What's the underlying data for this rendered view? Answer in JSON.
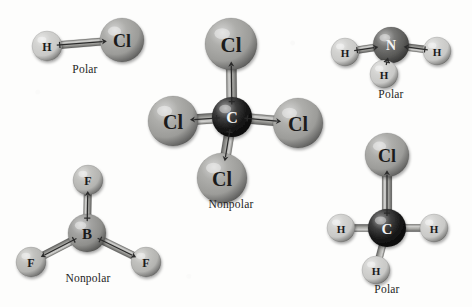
{
  "figure": {
    "background_color": "#fdfdfc",
    "style": "ball-and-stick with bond dipole arrows"
  },
  "palette": {
    "hydrogen": "#c9c9c7",
    "chlorine": "#9c9c99",
    "fluorine": "#b4b4b1",
    "carbon": "#141414",
    "nitrogen": "#5a5a58",
    "boron": "#8f8f8c",
    "bond": "#a9a9a5",
    "arrow": "#2a2a2a",
    "label_dark": "#1b1b1b",
    "label_light": "#f4f4f4",
    "caption": "#242424"
  },
  "molecules": [
    {
      "id": "hcl",
      "formula": "HCl",
      "caption": "Polar",
      "geometry": "linear",
      "net_dipole": "polar",
      "atoms": [
        {
          "element": "H",
          "label": "H",
          "label_color": "dark",
          "color": "#c9c9c7",
          "r": 15,
          "cx": 47,
          "cy": 46
        },
        {
          "element": "Cl",
          "label": "Cl",
          "label_color": "dark",
          "color": "#9c9c99",
          "r": 22,
          "cx": 122,
          "cy": 40
        }
      ],
      "bonds": [
        {
          "from": 0,
          "to": 1,
          "dipole": "toward-Cl"
        }
      ]
    },
    {
      "id": "ccl4",
      "formula": "CCl4",
      "caption": "Nonpolar",
      "geometry": "tetrahedral",
      "net_dipole": "nonpolar",
      "atoms": [
        {
          "element": "C",
          "label": "C",
          "label_color": "light",
          "color": "#141414",
          "r": 20,
          "cx": 232,
          "cy": 117
        },
        {
          "element": "Cl",
          "label": "Cl",
          "label_color": "dark",
          "color": "#9c9c99",
          "r": 26,
          "cx": 231,
          "cy": 44
        },
        {
          "element": "Cl",
          "label": "Cl",
          "label_color": "dark",
          "color": "#9c9c99",
          "r": 25,
          "cx": 173,
          "cy": 121
        },
        {
          "element": "Cl",
          "label": "Cl",
          "label_color": "dark",
          "color": "#9c9c99",
          "r": 25,
          "cx": 298,
          "cy": 123
        },
        {
          "element": "Cl",
          "label": "Cl",
          "label_color": "dark",
          "color": "#9c9c99",
          "r": 25,
          "cx": 222,
          "cy": 178
        }
      ],
      "bonds": [
        {
          "from": 0,
          "to": 1,
          "dipole": "toward-Cl"
        },
        {
          "from": 0,
          "to": 2,
          "dipole": "toward-Cl"
        },
        {
          "from": 0,
          "to": 3,
          "dipole": "toward-Cl"
        },
        {
          "from": 0,
          "to": 4,
          "dipole": "toward-Cl"
        }
      ]
    },
    {
      "id": "nh3",
      "formula": "NH3",
      "caption": "Polar",
      "geometry": "trigonal pyramidal",
      "net_dipole": "polar",
      "atoms": [
        {
          "element": "N",
          "label": "N",
          "label_color": "light",
          "color": "#5a5a58",
          "r": 18,
          "cx": 391,
          "cy": 45
        },
        {
          "element": "H",
          "label": "H",
          "label_color": "dark",
          "color": "#c9c9c7",
          "r": 14,
          "cx": 345,
          "cy": 52
        },
        {
          "element": "H",
          "label": "H",
          "label_color": "dark",
          "color": "#c9c9c7",
          "r": 14,
          "cx": 437,
          "cy": 51
        },
        {
          "element": "H",
          "label": "H",
          "label_color": "dark",
          "color": "#c9c9c7",
          "r": 14,
          "cx": 384,
          "cy": 74
        }
      ],
      "bonds": [
        {
          "from": 1,
          "to": 0,
          "dipole": "toward-N"
        },
        {
          "from": 2,
          "to": 0,
          "dipole": "toward-N"
        },
        {
          "from": 3,
          "to": 0,
          "dipole": "toward-N"
        }
      ]
    },
    {
      "id": "bf3",
      "formula": "BF3",
      "caption": "Nonpolar",
      "geometry": "trigonal planar",
      "net_dipole": "nonpolar",
      "atoms": [
        {
          "element": "B",
          "label": "B",
          "label_color": "dark",
          "color": "#8f8f8c",
          "r": 19,
          "cx": 87,
          "cy": 233
        },
        {
          "element": "F",
          "label": "F",
          "label_color": "dark",
          "color": "#b4b4b1",
          "r": 15,
          "cx": 88,
          "cy": 180
        },
        {
          "element": "F",
          "label": "F",
          "label_color": "dark",
          "color": "#b4b4b1",
          "r": 15,
          "cx": 31,
          "cy": 262
        },
        {
          "element": "F",
          "label": "F",
          "label_color": "dark",
          "color": "#b4b4b1",
          "r": 15,
          "cx": 146,
          "cy": 262
        }
      ],
      "bonds": [
        {
          "from": 0,
          "to": 1,
          "dipole": "toward-F"
        },
        {
          "from": 0,
          "to": 2,
          "dipole": "toward-F"
        },
        {
          "from": 0,
          "to": 3,
          "dipole": "toward-F"
        }
      ]
    },
    {
      "id": "ch3cl",
      "formula": "CH3Cl",
      "caption": "Polar",
      "geometry": "tetrahedral",
      "net_dipole": "polar",
      "atoms": [
        {
          "element": "C",
          "label": "C",
          "label_color": "light",
          "color": "#141414",
          "r": 19,
          "cx": 387,
          "cy": 228
        },
        {
          "element": "Cl",
          "label": "Cl",
          "label_color": "dark",
          "color": "#9c9c99",
          "r": 22,
          "cx": 387,
          "cy": 155
        },
        {
          "element": "H",
          "label": "H",
          "label_color": "dark",
          "color": "#c9c9c7",
          "r": 14,
          "cx": 341,
          "cy": 228
        },
        {
          "element": "H",
          "label": "H",
          "label_color": "dark",
          "color": "#c9c9c7",
          "r": 14,
          "cx": 434,
          "cy": 228
        },
        {
          "element": "H",
          "label": "H",
          "label_color": "dark",
          "color": "#c9c9c7",
          "r": 14,
          "cx": 376,
          "cy": 270
        }
      ],
      "bonds": [
        {
          "from": 0,
          "to": 1,
          "dipole": "toward-Cl"
        },
        {
          "from": 0,
          "to": 2,
          "dipole": "none"
        },
        {
          "from": 0,
          "to": 3,
          "dipole": "none"
        },
        {
          "from": 0,
          "to": 4,
          "dipole": "none"
        }
      ]
    }
  ],
  "captions": [
    {
      "id": "cap-hcl",
      "text": "Polar",
      "x": 55,
      "y": 63,
      "w": 60
    },
    {
      "id": "cap-ccl4",
      "text": "Nonpolar",
      "x": 185,
      "y": 198,
      "w": 92
    },
    {
      "id": "cap-nh3",
      "text": "Polar",
      "x": 361,
      "y": 88,
      "w": 60
    },
    {
      "id": "cap-bf3",
      "text": "Nonpolar",
      "x": 42,
      "y": 272,
      "w": 92
    },
    {
      "id": "cap-ch3cl",
      "text": "Polar",
      "x": 357,
      "y": 283,
      "w": 60
    }
  ]
}
